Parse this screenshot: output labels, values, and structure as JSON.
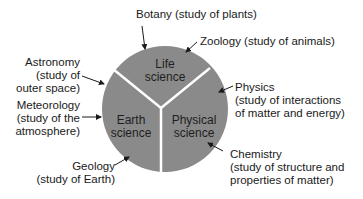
{
  "diagram": {
    "type": "pie-categories",
    "colors": {
      "circle": "#8a8a8a",
      "divider": "#ffffff",
      "text": "#1a1a1a",
      "arrow": "#1a1a1a"
    },
    "segments": [
      {
        "name": "life",
        "line1": "Life",
        "line2": "science"
      },
      {
        "name": "earth",
        "line1": "Earth",
        "line2": "science"
      },
      {
        "name": "physical",
        "line1": "Physical",
        "line2": "science"
      }
    ],
    "labels": {
      "botany": {
        "line1": "Botany (study of plants)"
      },
      "zoology": {
        "line1": "Zoology (study of animals)"
      },
      "astronomy": {
        "line1": "Astronomy",
        "line2": "(study of",
        "line3": "outer space)"
      },
      "meteorology": {
        "line1": "Meteorology",
        "line2": "(study of the",
        "line3": "atmosphere)"
      },
      "geology": {
        "line1": "Geology",
        "line2": "(study of Earth)"
      },
      "physics": {
        "line1": "Physics",
        "line2": "(study of interactions",
        "line3": "of matter and energy)"
      },
      "chemistry": {
        "line1": "Chemistry",
        "line2": "(study of structure and",
        "line3": "properties of matter)"
      }
    }
  }
}
